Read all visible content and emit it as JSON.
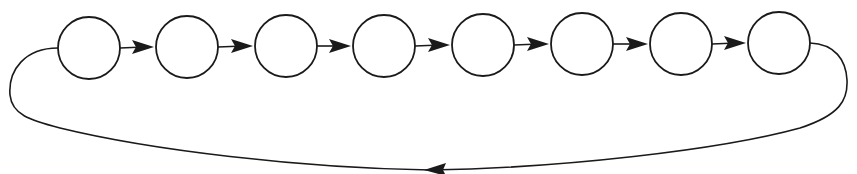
{
  "diagram": {
    "type": "circular linked list / cycle",
    "node_count": 8,
    "nodes": [
      {
        "id": "n1",
        "cx": 89,
        "cy": 48,
        "r": 31,
        "label": ""
      },
      {
        "id": "n2",
        "cx": 187,
        "cy": 47,
        "r": 31,
        "label": ""
      },
      {
        "id": "n3",
        "cx": 286,
        "cy": 46,
        "r": 31,
        "label": ""
      },
      {
        "id": "n4",
        "cx": 384,
        "cy": 46,
        "r": 31,
        "label": ""
      },
      {
        "id": "n5",
        "cx": 483,
        "cy": 45,
        "r": 31,
        "label": ""
      },
      {
        "id": "n6",
        "cx": 582,
        "cy": 44,
        "r": 31,
        "label": ""
      },
      {
        "id": "n7",
        "cx": 681,
        "cy": 44,
        "r": 31,
        "label": ""
      },
      {
        "id": "n8",
        "cx": 779,
        "cy": 43,
        "r": 31,
        "label": ""
      }
    ],
    "edges": [
      {
        "from": "n1",
        "to": "n2"
      },
      {
        "from": "n2",
        "to": "n3"
      },
      {
        "from": "n3",
        "to": "n4"
      },
      {
        "from": "n4",
        "to": "n5"
      },
      {
        "from": "n5",
        "to": "n6"
      },
      {
        "from": "n6",
        "to": "n7"
      },
      {
        "from": "n7",
        "to": "n8"
      },
      {
        "from": "n8",
        "to": "n1",
        "style": "curved return loop below nodes"
      }
    ],
    "colors": {
      "stroke": "#1a1a1a",
      "fill": "#ffffff",
      "background": "#ffffff"
    }
  }
}
